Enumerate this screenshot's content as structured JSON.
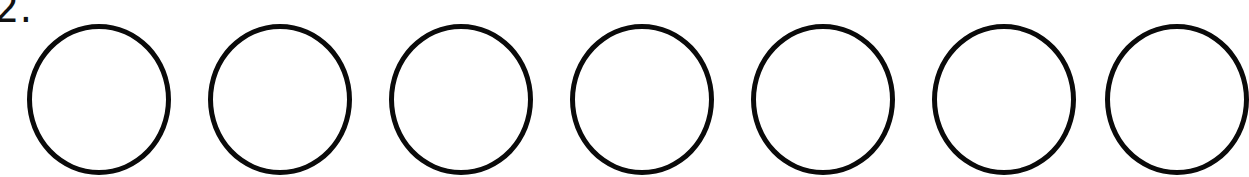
{
  "problem": {
    "number_label": "2.",
    "circle_count": 7,
    "circles": [
      {
        "index": 1,
        "filled": false
      },
      {
        "index": 2,
        "filled": false
      },
      {
        "index": 3,
        "filled": false
      },
      {
        "index": 4,
        "filled": false
      },
      {
        "index": 5,
        "filled": false
      },
      {
        "index": 6,
        "filled": false
      },
      {
        "index": 7,
        "filled": false
      }
    ],
    "stroke_color": "#0a0a0a",
    "background_color": "#ffffff"
  }
}
